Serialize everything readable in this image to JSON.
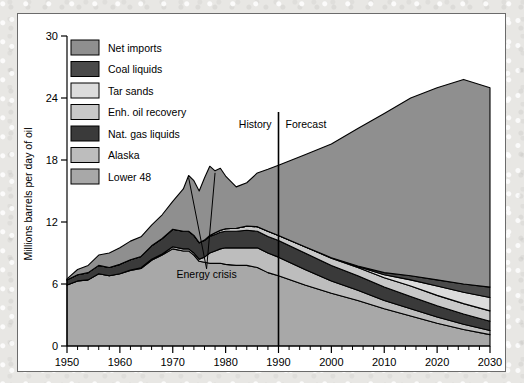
{
  "chart_data": {
    "type": "area",
    "title": "",
    "subtitle": "",
    "xlabel": "",
    "ylabel": "Millions barrels per day of oil",
    "xlim": [
      1950,
      2030
    ],
    "ylim": [
      0,
      30
    ],
    "xticks": [
      1950,
      1960,
      1970,
      1980,
      1990,
      2000,
      2010,
      2020,
      2030
    ],
    "yticks": [
      0,
      6,
      12,
      18,
      24,
      30
    ],
    "xtick_labels": [
      "1950",
      "1960",
      "1970",
      "1980",
      "1990",
      "2000",
      "2010",
      "2020",
      "2030"
    ],
    "ytick_labels": [
      "0",
      "6",
      "12",
      "18",
      "24",
      "30"
    ],
    "minor_xtick_interval": 2,
    "grid": false,
    "stacked": true,
    "legend_position": "upper-left-inside",
    "x": [
      1950,
      1952,
      1954,
      1956,
      1958,
      1960,
      1962,
      1964,
      1966,
      1968,
      1970,
      1972,
      1973,
      1974,
      1975,
      1976,
      1977,
      1978,
      1979,
      1980,
      1982,
      1984,
      1986,
      1988,
      1990,
      1995,
      2000,
      2005,
      2010,
      2015,
      2020,
      2025,
      2030
    ],
    "series": [
      {
        "name": "Lower 48",
        "color": "#a8a8a8",
        "order": 1,
        "values": [
          5.9,
          6.3,
          6.4,
          7.0,
          6.8,
          7.0,
          7.3,
          7.5,
          8.3,
          8.8,
          9.4,
          9.2,
          9.2,
          8.8,
          8.2,
          8.1,
          8.0,
          8.0,
          8.0,
          7.9,
          7.8,
          7.8,
          7.6,
          7.1,
          6.8,
          5.9,
          5.1,
          4.4,
          3.6,
          2.9,
          2.2,
          1.6,
          1.1
        ]
      },
      {
        "name": "Alaska",
        "color": "#bdbdbd",
        "order": 2,
        "values": [
          0.0,
          0.0,
          0.0,
          0.0,
          0.0,
          0.0,
          0.05,
          0.07,
          0.1,
          0.1,
          0.2,
          0.2,
          0.2,
          0.2,
          0.2,
          0.5,
          1.0,
          1.2,
          1.4,
          1.6,
          1.7,
          1.7,
          1.9,
          1.9,
          1.8,
          1.5,
          1.2,
          1.0,
          0.8,
          0.7,
          0.6,
          0.5,
          0.4
        ]
      },
      {
        "name": "Nat. gas liquids",
        "color": "#3a3a3a",
        "order": 3,
        "values": [
          0.5,
          0.6,
          0.7,
          0.8,
          0.8,
          0.9,
          1.0,
          1.1,
          1.3,
          1.5,
          1.7,
          1.7,
          1.7,
          1.7,
          1.6,
          1.6,
          1.6,
          1.6,
          1.6,
          1.6,
          1.6,
          1.7,
          1.6,
          1.6,
          1.6,
          1.6,
          1.5,
          1.4,
          1.3,
          1.2,
          1.1,
          1.0,
          0.9
        ]
      },
      {
        "name": "Enh. oil recovery",
        "color": "#c8c8c8",
        "order": 4,
        "values": [
          0.0,
          0.0,
          0.0,
          0.0,
          0.0,
          0.0,
          0.0,
          0.0,
          0.0,
          0.0,
          0.0,
          0.0,
          0.0,
          0.0,
          0.0,
          0.05,
          0.1,
          0.15,
          0.2,
          0.25,
          0.3,
          0.4,
          0.45,
          0.5,
          0.5,
          0.6,
          0.7,
          0.8,
          0.9,
          1.0,
          1.0,
          1.0,
          1.0
        ]
      },
      {
        "name": "Tar sands",
        "color": "#dcdcdc",
        "order": 5,
        "values": [
          0.0,
          0.0,
          0.0,
          0.0,
          0.0,
          0.0,
          0.0,
          0.0,
          0.0,
          0.0,
          0.0,
          0.0,
          0.0,
          0.0,
          0.0,
          0.0,
          0.0,
          0.0,
          0.0,
          0.0,
          0.0,
          0.0,
          0.0,
          0.0,
          0.0,
          0.0,
          0.05,
          0.1,
          0.3,
          0.6,
          0.9,
          1.1,
          1.3
        ]
      },
      {
        "name": "Coal liquids",
        "color": "#4a4a4a",
        "order": 6,
        "values": [
          0.0,
          0.0,
          0.0,
          0.0,
          0.0,
          0.0,
          0.0,
          0.0,
          0.0,
          0.0,
          0.0,
          0.0,
          0.0,
          0.0,
          0.0,
          0.0,
          0.0,
          0.0,
          0.0,
          0.0,
          0.0,
          0.0,
          0.0,
          0.0,
          0.0,
          0.0,
          0.0,
          0.05,
          0.2,
          0.4,
          0.6,
          0.8,
          1.0
        ]
      },
      {
        "name": "Net imports",
        "color": "#8f8f8f",
        "order": 7,
        "values": [
          0.1,
          0.5,
          0.7,
          1.0,
          1.4,
          1.6,
          1.8,
          1.9,
          2.0,
          2.3,
          2.7,
          4.1,
          5.4,
          5.3,
          5.0,
          6.0,
          6.7,
          6.0,
          6.0,
          5.1,
          4.0,
          4.2,
          5.2,
          6.0,
          6.8,
          8.9,
          11.0,
          13.3,
          15.4,
          17.2,
          18.6,
          19.8,
          19.3
        ]
      }
    ],
    "totals_note": {
      "1950": 6.5,
      "1977": 17.4,
      "1978": 17.0,
      "1985": 15.4,
      "1990": 17.5,
      "2030": 24.0
    },
    "annotations": [
      {
        "name": "energy-crisis",
        "text": "Energy crisis",
        "points": [
          1973,
          1978
        ]
      },
      {
        "name": "history",
        "text": "History"
      },
      {
        "name": "forecast",
        "text": "Forecast"
      }
    ],
    "divider": {
      "name": "history-forecast-divider",
      "x": 1990
    }
  },
  "legend": {
    "items": [
      {
        "label": "Net imports",
        "color": "#8f8f8f"
      },
      {
        "label": "Coal liquids",
        "color": "#4a4a4a"
      },
      {
        "label": "Tar sands",
        "color": "#dcdcdc"
      },
      {
        "label": "Enh. oil recovery",
        "color": "#c8c8c8"
      },
      {
        "label": "Nat. gas liquids",
        "color": "#3a3a3a"
      },
      {
        "label": "Alaska",
        "color": "#bdbdbd"
      },
      {
        "label": "Lower 48",
        "color": "#a8a8a8"
      }
    ]
  },
  "axes": {
    "y_title": "Millions barrels per day of oil",
    "y_ticks": [
      "30",
      "24",
      "18",
      "12",
      "6",
      "0"
    ],
    "x_ticks": [
      "1950",
      "1960",
      "1970",
      "1980",
      "1990",
      "2000",
      "2010",
      "2020",
      "2030"
    ]
  },
  "labels": {
    "history": "History",
    "forecast": "Forecast",
    "energy_crisis": "Energy crisis"
  },
  "colors": {
    "axis": "#000000",
    "panel_bg": "#ffffff",
    "panel_border": "#6b6b6b",
    "page_bg": "#e8e7e4"
  }
}
